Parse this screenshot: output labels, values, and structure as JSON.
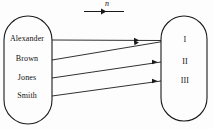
{
  "figure": {
    "type": "mapping-diagram",
    "legend": {
      "symbol": "n",
      "arrow_direction": "left-to-right"
    },
    "domain_set": {
      "name": "names",
      "items": [
        {
          "label": "Alexander",
          "y": 39
        },
        {
          "label": "Brown",
          "y": 59
        },
        {
          "label": "Jones",
          "y": 78
        },
        {
          "label": "Smith",
          "y": 96
        }
      ]
    },
    "codomain_set": {
      "name": "numerals",
      "items": [
        {
          "label": "I",
          "y": 40
        },
        {
          "label": "II",
          "y": 62
        },
        {
          "label": "III",
          "y": 81
        }
      ]
    },
    "mappings": [
      {
        "from": "Alexander",
        "to": "I"
      },
      {
        "from": "Brown",
        "to": "I"
      },
      {
        "from": "Jones",
        "to": "II"
      },
      {
        "from": "Smith",
        "to": "III"
      }
    ],
    "colors": {
      "stroke": "#1a1a1a",
      "text": "#111111",
      "background": "#fdfdfd"
    }
  }
}
